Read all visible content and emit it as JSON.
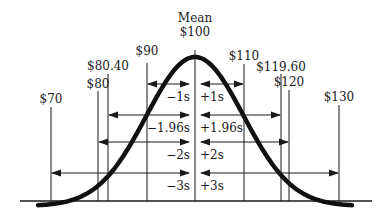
{
  "diagram": {
    "type": "normal-distribution",
    "mean_label_title": "Mean",
    "mean_label_value": "$100",
    "values": [
      {
        "id": "v70",
        "label": "$70",
        "x": 51,
        "label_y": 103,
        "line_top": 107
      },
      {
        "id": "v80",
        "label": "$80",
        "x": 98,
        "label_y": 88,
        "line_top": 91
      },
      {
        "id": "v8040",
        "label": "$80.40",
        "x": 108,
        "label_y": 70,
        "line_top": 74
      },
      {
        "id": "v90",
        "label": "$90",
        "x": 147,
        "label_y": 55,
        "line_top": 63
      },
      {
        "id": "v100",
        "label": "$100",
        "x": 195,
        "label_y": 36,
        "line_top": 50
      },
      {
        "id": "v110",
        "label": "$110",
        "x": 244,
        "label_y": 60,
        "line_top": 64
      },
      {
        "id": "v11960",
        "label": "$119.60",
        "x": 281,
        "label_y": 71,
        "line_top": 74
      },
      {
        "id": "v120",
        "label": "$120",
        "x": 289,
        "label_y": 86,
        "line_top": 90
      },
      {
        "id": "v130",
        "label": "$130",
        "x": 339,
        "label_y": 101,
        "line_top": 105
      }
    ],
    "intervals": [
      {
        "left_label": "−1s",
        "right_label": "+1s",
        "y": 84,
        "left_x": 147,
        "right_x": 244
      },
      {
        "left_label": "−1.96s",
        "right_label": "+1.96s",
        "y": 115,
        "left_x": 108,
        "right_x": 281
      },
      {
        "left_label": "−2s",
        "right_label": "+2s",
        "y": 142,
        "left_x": 98,
        "right_x": 289
      },
      {
        "left_label": "−3s",
        "right_label": "+3s",
        "y": 173,
        "left_x": 51,
        "right_x": 339
      }
    ],
    "baseline_y": 201,
    "colors": {
      "ink": "#1a1a1a",
      "background": "#ffffff"
    }
  }
}
